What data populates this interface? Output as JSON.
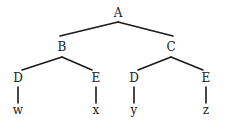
{
  "figure": {
    "kind": "parse-tree",
    "width": 231,
    "height": 129,
    "background_color": "#ffffff",
    "line_color": "#1a1a1a",
    "text_color": "#1a1a1a",
    "line_width": 1.6
  },
  "nodes": {
    "root": {
      "label": "A",
      "x": 118,
      "y": 13
    },
    "b": {
      "label": "B",
      "x": 62,
      "y": 47
    },
    "c": {
      "label": "C",
      "x": 171,
      "y": 47
    },
    "d_left": {
      "label": "D",
      "x": 18,
      "y": 78
    },
    "e_left": {
      "label": "E",
      "x": 96,
      "y": 78
    },
    "d_right": {
      "label": "D",
      "x": 134,
      "y": 78
    },
    "e_right": {
      "label": "E",
      "x": 206,
      "y": 78
    },
    "leaf_w": {
      "label": "w",
      "x": 18,
      "y": 110
    },
    "leaf_x": {
      "label": "x",
      "x": 96,
      "y": 110
    },
    "leaf_y": {
      "label": "y",
      "x": 134,
      "y": 110
    },
    "leaf_z": {
      "label": "z",
      "x": 206,
      "y": 110
    }
  },
  "edges": [
    {
      "name": "edge-a-b",
      "from": "root",
      "to": "b",
      "x1": 118,
      "y1": 22,
      "x2": 60,
      "y2": 36
    },
    {
      "name": "edge-a-c",
      "from": "root",
      "to": "c",
      "x1": 118,
      "y1": 22,
      "x2": 173,
      "y2": 36
    },
    {
      "name": "edge-b-d",
      "from": "b",
      "to": "d_left",
      "x1": 62,
      "y1": 57,
      "x2": 22,
      "y2": 70
    },
    {
      "name": "edge-b-e",
      "from": "b",
      "to": "e_left",
      "x1": 62,
      "y1": 57,
      "x2": 92,
      "y2": 70
    },
    {
      "name": "edge-c-d",
      "from": "c",
      "to": "d_right",
      "x1": 171,
      "y1": 57,
      "x2": 138,
      "y2": 70
    },
    {
      "name": "edge-c-e",
      "from": "c",
      "to": "e_right",
      "x1": 171,
      "y1": 57,
      "x2": 203,
      "y2": 70
    },
    {
      "name": "edge-d-w",
      "from": "d_left",
      "to": "leaf_w",
      "x1": 18,
      "y1": 87,
      "x2": 18,
      "y2": 103
    },
    {
      "name": "edge-e-x",
      "from": "e_left",
      "to": "leaf_x",
      "x1": 96,
      "y1": 87,
      "x2": 96,
      "y2": 103
    },
    {
      "name": "edge-d-y",
      "from": "d_right",
      "to": "leaf_y",
      "x1": 134,
      "y1": 87,
      "x2": 134,
      "y2": 103
    },
    {
      "name": "edge-e-z",
      "from": "e_right",
      "to": "leaf_z",
      "x1": 206,
      "y1": 87,
      "x2": 206,
      "y2": 103
    }
  ],
  "node_order": [
    {
      "key": "root",
      "name": "tree-node-a-root",
      "type": "nonterminal"
    },
    {
      "key": "b",
      "name": "tree-node-b",
      "type": "nonterminal"
    },
    {
      "key": "c",
      "name": "tree-node-c",
      "type": "nonterminal"
    },
    {
      "key": "d_left",
      "name": "tree-node-d-left",
      "type": "nonterminal"
    },
    {
      "key": "e_left",
      "name": "tree-node-e-left",
      "type": "nonterminal"
    },
    {
      "key": "d_right",
      "name": "tree-node-d-right",
      "type": "nonterminal"
    },
    {
      "key": "e_right",
      "name": "tree-node-e-right",
      "type": "nonterminal"
    },
    {
      "key": "leaf_w",
      "name": "tree-leaf-w",
      "type": "terminal"
    },
    {
      "key": "leaf_x",
      "name": "tree-leaf-x",
      "type": "terminal"
    },
    {
      "key": "leaf_y",
      "name": "tree-leaf-y",
      "type": "terminal"
    },
    {
      "key": "leaf_z",
      "name": "tree-leaf-z",
      "type": "terminal"
    }
  ]
}
